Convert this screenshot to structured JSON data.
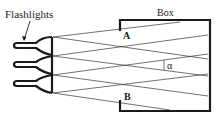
{
  "diagram": {
    "labels": {
      "flashlights": "Flashlights",
      "box": "Box",
      "point_a": "A",
      "point_b": "B",
      "angle": "α"
    },
    "colors": {
      "stroke": "#1a1a1a",
      "ray": "#333333",
      "background": "#ffffff"
    },
    "flashlight_count": 3
  }
}
